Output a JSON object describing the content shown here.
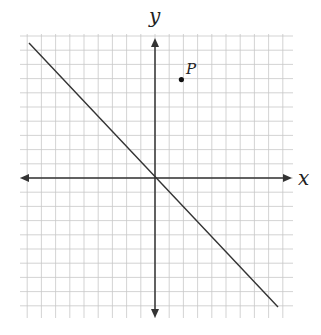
{
  "diagram": {
    "x_label": "x",
    "y_label": "y",
    "point_label": "P",
    "point": [
      2,
      7
    ],
    "line": {
      "slope": -1,
      "intercept": 0
    },
    "grid": {
      "xmin": -9,
      "xmax": 9,
      "ymin": -10,
      "ymax": 10,
      "step": 1
    },
    "colors": {
      "grid": "#c8c8c8",
      "axis": "#333333",
      "line": "#333333"
    }
  }
}
